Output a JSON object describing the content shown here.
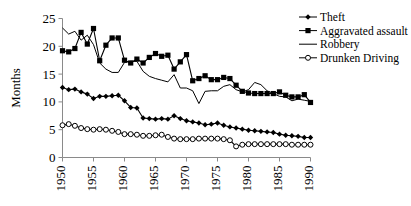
{
  "chart_data": {
    "type": "line",
    "title": "",
    "xlabel": "",
    "ylabel": "Months",
    "ylim": [
      0,
      25
    ],
    "xlim": [
      1950,
      1990
    ],
    "y_ticks": [
      "0",
      "5",
      "10",
      "15",
      "20",
      "25"
    ],
    "x_ticks": [
      "1950",
      "1955",
      "1960",
      "1965",
      "1970",
      "1975",
      "1980",
      "1985",
      "1990"
    ],
    "grid": false,
    "legend_position": "top-right",
    "x": [
      1950,
      1951,
      1952,
      1953,
      1954,
      1955,
      1956,
      1957,
      1958,
      1959,
      1960,
      1961,
      1962,
      1963,
      1964,
      1965,
      1966,
      1967,
      1968,
      1969,
      1970,
      1971,
      1972,
      1973,
      1974,
      1975,
      1976,
      1977,
      1978,
      1979,
      1980,
      1981,
      1982,
      1983,
      1984,
      1985,
      1986,
      1987,
      1988,
      1989,
      1990
    ],
    "series": [
      {
        "name": "Theft",
        "marker": "diamond",
        "color": "#000000",
        "values": [
          12.6,
          12.2,
          12.3,
          11.8,
          11.4,
          10.6,
          11.0,
          11.0,
          11.1,
          11.2,
          10.2,
          9.0,
          8.9,
          7.1,
          7.0,
          6.9,
          7.0,
          6.9,
          7.5,
          7.0,
          6.6,
          6.4,
          6.2,
          5.9,
          6.0,
          6.2,
          5.8,
          5.5,
          5.3,
          5.1,
          4.9,
          4.8,
          4.7,
          4.6,
          4.5,
          4.2,
          4.0,
          3.9,
          3.8,
          3.6,
          3.6
        ]
      },
      {
        "name": "Aggravated assault",
        "marker": "square",
        "color": "#000000",
        "values": [
          19.2,
          19.0,
          19.6,
          22.5,
          20.4,
          23.2,
          17.4,
          20.2,
          21.5,
          21.5,
          17.5,
          17.0,
          17.7,
          17.0,
          18.0,
          18.7,
          18.2,
          18.4,
          15.9,
          17.2,
          18.5,
          13.8,
          14.2,
          14.7,
          14.0,
          14.0,
          14.4,
          14.2,
          13.0,
          11.9,
          11.6,
          11.5,
          11.5,
          11.5,
          11.5,
          11.8,
          11.2,
          10.9,
          10.9,
          11.3,
          9.9
        ]
      },
      {
        "name": "Robbery",
        "marker": "none",
        "color": "#000000",
        "values": [
          23.3,
          22.2,
          22.7,
          21.1,
          22.0,
          20.3,
          17.0,
          15.9,
          15.3,
          15.3,
          17.1,
          17.3,
          17.3,
          15.5,
          14.6,
          14.2,
          13.9,
          13.6,
          14.9,
          12.5,
          12.5,
          12.0,
          9.7,
          11.9,
          12.0,
          12.0,
          12.8,
          13.1,
          12.2,
          11.8,
          12.2,
          13.5,
          13.1,
          12.0,
          11.5,
          11.0,
          10.9,
          10.2,
          10.5,
          10.3,
          10.1
        ]
      },
      {
        "name": "Drunken Driving",
        "marker": "circle",
        "color": "#000000",
        "values": [
          5.8,
          6.0,
          5.7,
          5.3,
          5.1,
          5.0,
          5.1,
          5.0,
          4.8,
          4.6,
          4.2,
          4.2,
          4.1,
          3.9,
          3.9,
          4.0,
          4.1,
          3.7,
          3.4,
          3.3,
          3.3,
          3.3,
          3.4,
          3.4,
          3.4,
          3.4,
          3.3,
          3.1,
          2.0,
          2.3,
          2.4,
          2.4,
          2.4,
          2.4,
          2.4,
          2.4,
          2.4,
          2.3,
          2.3,
          2.3,
          2.3
        ]
      }
    ],
    "legend": [
      {
        "label": "Theft",
        "marker": "diamond"
      },
      {
        "label": "Aggravated assault",
        "marker": "square"
      },
      {
        "label": "Robbery",
        "marker": "none"
      },
      {
        "label": "Drunken Driving",
        "marker": "circle"
      }
    ]
  }
}
